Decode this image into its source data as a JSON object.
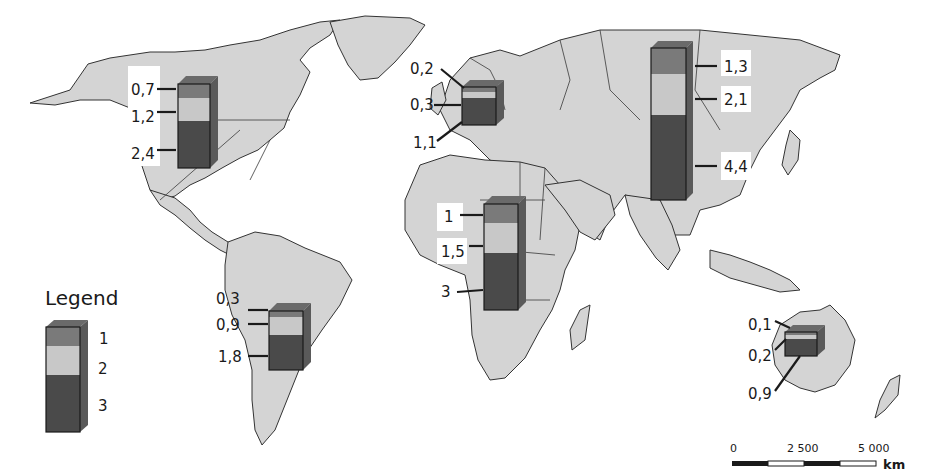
{
  "map": {
    "type": "world-choropleth-stacked-bars",
    "colors": {
      "land": "#d4d4d4",
      "coast": "#333333",
      "category_1": "#7a7a7a",
      "category_2": "#c8c8c8",
      "category_3": "#4a4a4a"
    }
  },
  "legend": {
    "title": "Legend",
    "items": [
      {
        "label": "1",
        "color": "#7a7a7a"
      },
      {
        "label": "2",
        "color": "#c8c8c8"
      },
      {
        "label": "3",
        "color": "#4a4a4a"
      }
    ]
  },
  "regions": [
    {
      "name": "North America",
      "values": [
        "0,7",
        "1,2",
        "2,4"
      ],
      "numeric": [
        0.7,
        1.2,
        2.4
      ]
    },
    {
      "name": "Europe",
      "values": [
        "0,2",
        "0,3",
        "1,1"
      ],
      "numeric": [
        0.2,
        0.3,
        1.1
      ]
    },
    {
      "name": "Asia",
      "values": [
        "1,3",
        "2,1",
        "4,4"
      ],
      "numeric": [
        1.3,
        2.1,
        4.4
      ]
    },
    {
      "name": "Africa",
      "values": [
        "1",
        "1,5",
        "3"
      ],
      "numeric": [
        1,
        1.5,
        3
      ]
    },
    {
      "name": "South America",
      "values": [
        "0,3",
        "0,9",
        "1,8"
      ],
      "numeric": [
        0.3,
        0.9,
        1.8
      ]
    },
    {
      "name": "Oceania",
      "values": [
        "0,1",
        "0,2",
        "0,9"
      ],
      "numeric": [
        0.1,
        0.2,
        0.9
      ]
    }
  ],
  "scale_bar": {
    "ticks": [
      "0",
      "2 500",
      "5 000"
    ],
    "unit": "km"
  }
}
